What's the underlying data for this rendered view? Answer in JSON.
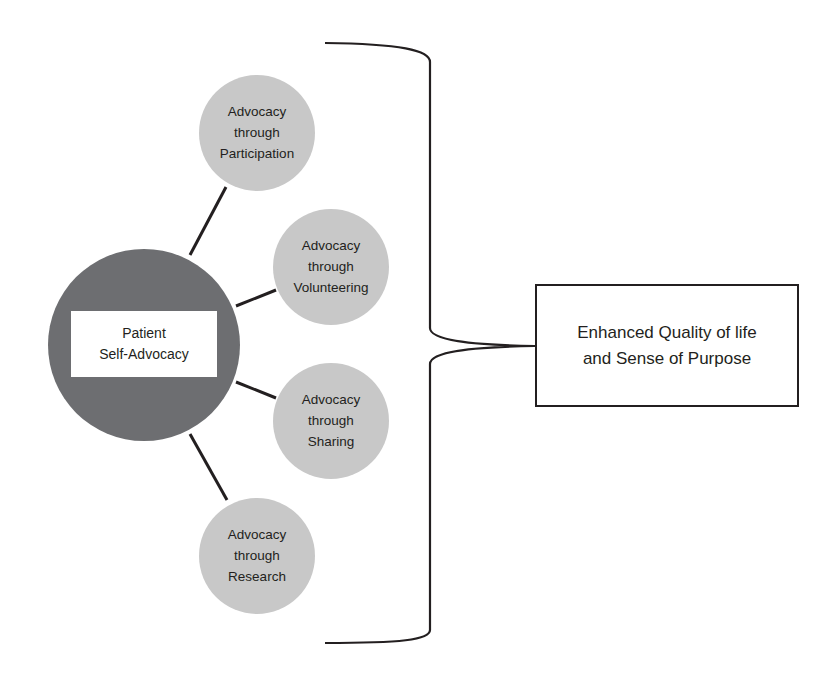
{
  "diagram": {
    "core": {
      "line1": "Patient",
      "line2": "Self-Advocacy"
    },
    "branches": [
      {
        "line1": "Advocacy",
        "line2": "through",
        "line3": "Participation"
      },
      {
        "line1": "Advocacy",
        "line2": "through",
        "line3": "Volunteering"
      },
      {
        "line1": "Advocacy",
        "line2": "through",
        "line3": "Sharing"
      },
      {
        "line1": "Advocacy",
        "line2": "through",
        "line3": "Research"
      }
    ],
    "outcome": {
      "line1": "Enhanced Quality of life",
      "line2": "and Sense of Purpose"
    },
    "colors": {
      "core_circle": "#6d6e71",
      "branch_circle": "#c8c8c8",
      "stroke": "#231f20",
      "background": "#ffffff"
    }
  }
}
